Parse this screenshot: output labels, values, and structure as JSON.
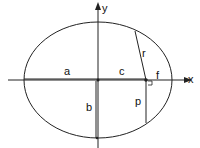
{
  "diagram": {
    "type": "ellipse-geometry",
    "labels": {
      "y_axis": "y",
      "x_axis": "x",
      "semi_major": "a",
      "semi_minor": "b",
      "focal_distance": "c",
      "focus_to_vertex": "f",
      "radius_vector": "r",
      "semi_latus_rectum": "p"
    },
    "colors": {
      "stroke": "#222222",
      "background": "#ffffff"
    }
  }
}
